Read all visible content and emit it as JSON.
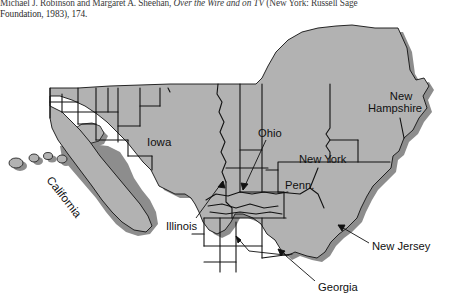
{
  "footnote": {
    "line1": "Michael J. Robinson and Margaret A. Sheehan, Over the Wire and on TV (New York: Russell Sage",
    "line1_plain_a": "Michael J. Robinson and Margaret A. Sheehan, ",
    "line1_italic": "Over the Wire and on TV",
    "line1_plain_b": " (New York: Russell Sage",
    "line2": "Foundation, 1983), 174."
  },
  "figure": {
    "type": "cartogram-map",
    "fill_color": "#b2b2b2",
    "shadow_color": "#8d8d8d",
    "outline_color": "#111111",
    "background_color": "#ffffff"
  },
  "labels": {
    "iowa": "Iowa",
    "california": "California",
    "illinois": "Illinois",
    "ohio": "Ohio",
    "new_york": "New York",
    "penn": "Penn.",
    "new_hampshire_line1": "New",
    "new_hampshire_line2": "Hampshire",
    "new_jersey": "New Jersey",
    "georgia": "Georgia"
  },
  "leader_lines": [
    {
      "name": "illinois",
      "from": [
        196,
        198
      ],
      "to": [
        222,
        160
      ]
    },
    {
      "name": "ohio",
      "from": [
        264,
        120
      ],
      "to": [
        242,
        168
      ]
    },
    {
      "name": "new_jersey",
      "from": [
        368,
        222
      ],
      "to": [
        337,
        203
      ]
    },
    {
      "name": "georgia",
      "from": [
        314,
        262
      ],
      "to": [
        277,
        228
      ]
    },
    {
      "name": "georgia_secondary",
      "from": [
        314,
        262
      ],
      "to": [
        250,
        230
      ]
    }
  ]
}
